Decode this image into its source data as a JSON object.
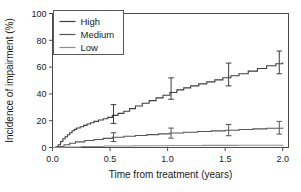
{
  "chart_data": {
    "type": "line",
    "title": "",
    "xlabel": "Time from treatment (years)",
    "ylabel": "Incidence of impairment (%)",
    "xlim": [
      0,
      2.05
    ],
    "ylim": [
      0,
      100
    ],
    "xticks": [
      0.0,
      0.5,
      1.0,
      1.5,
      2.0
    ],
    "xticklabels": [
      "0.0",
      "0.5",
      "1.0",
      "1.5",
      "2.0"
    ],
    "yticks": [
      0,
      20,
      40,
      60,
      80,
      100
    ],
    "yticklabels": [
      "0",
      "20",
      "40",
      "60",
      "80",
      "100"
    ],
    "grid": false,
    "legend_position": "top-left",
    "legend_entries": [
      "High",
      "Medium",
      "Low"
    ],
    "series": [
      {
        "name": "High",
        "color": "#3d3d3d",
        "x": [
          0.0,
          0.03,
          0.05,
          0.07,
          0.09,
          0.11,
          0.13,
          0.15,
          0.17,
          0.19,
          0.21,
          0.24,
          0.27,
          0.3,
          0.33,
          0.36,
          0.4,
          0.44,
          0.48,
          0.52,
          0.57,
          0.62,
          0.67,
          0.72,
          0.78,
          0.84,
          0.9,
          0.96,
          1.02,
          1.08,
          1.14,
          1.2,
          1.27,
          1.34,
          1.41,
          1.48,
          1.55,
          1.62,
          1.7,
          1.78,
          1.86,
          1.94,
          2.0
        ],
        "values": [
          0.0,
          0.5,
          2.0,
          4.5,
          6.5,
          8.0,
          9.5,
          11.0,
          12.5,
          13.5,
          14.5,
          15.5,
          16.5,
          17.5,
          18.5,
          19.5,
          20.5,
          21.5,
          22.5,
          24.0,
          25.5,
          27.0,
          29.0,
          31.0,
          33.0,
          35.0,
          37.0,
          39.0,
          41.0,
          43.0,
          44.5,
          46.0,
          47.5,
          49.0,
          50.5,
          52.0,
          53.5,
          55.0,
          57.0,
          59.0,
          61.0,
          62.5,
          63.5
        ]
      },
      {
        "name": "Medium",
        "color": "#555555",
        "x": [
          0.0,
          0.05,
          0.1,
          0.15,
          0.2,
          0.28,
          0.36,
          0.44,
          0.52,
          0.62,
          0.72,
          0.82,
          0.92,
          1.02,
          1.14,
          1.26,
          1.38,
          1.5,
          1.62,
          1.74,
          1.86,
          2.0
        ],
        "values": [
          0.0,
          0.8,
          2.0,
          3.2,
          4.2,
          5.2,
          6.0,
          6.8,
          7.6,
          8.4,
          9.0,
          9.6,
          10.2,
          10.8,
          11.4,
          11.9,
          12.4,
          12.9,
          13.4,
          13.9,
          14.4,
          15.0
        ]
      },
      {
        "name": "Low",
        "color": "#8e8e8e",
        "x": [
          0.0,
          0.1,
          0.25,
          0.45,
          0.7,
          1.0,
          1.3,
          1.6,
          2.0
        ],
        "values": [
          0.0,
          0.4,
          0.8,
          1.1,
          1.3,
          1.5,
          1.6,
          1.7,
          1.8
        ]
      }
    ],
    "errorbars": [
      {
        "series": "High",
        "x": 0.53,
        "y": 25.0,
        "low": 18.0,
        "high": 32.0
      },
      {
        "series": "High",
        "x": 1.03,
        "y": 44.0,
        "low": 36.0,
        "high": 52.0
      },
      {
        "series": "High",
        "x": 1.53,
        "y": 54.5,
        "low": 46.0,
        "high": 63.0
      },
      {
        "series": "High",
        "x": 1.97,
        "y": 63.5,
        "low": 55.0,
        "high": 72.0
      },
      {
        "series": "Medium",
        "x": 0.53,
        "y": 7.8,
        "low": 4.5,
        "high": 11.0
      },
      {
        "series": "Medium",
        "x": 1.03,
        "y": 10.8,
        "low": 7.0,
        "high": 14.5
      },
      {
        "series": "Medium",
        "x": 1.53,
        "y": 13.0,
        "low": 8.8,
        "high": 17.2
      },
      {
        "series": "Medium",
        "x": 1.97,
        "y": 14.9,
        "low": 10.0,
        "high": 19.5
      }
    ]
  }
}
